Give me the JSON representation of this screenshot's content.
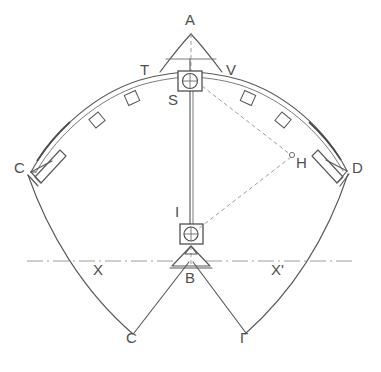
{
  "figure": {
    "type": "technical-line-drawing",
    "background_color": "#ffffff",
    "line_color": "#595959",
    "dashed_line_color": "#8d8d8d"
  },
  "labels": {
    "apex": "A",
    "left_shoulder": "T",
    "right_shoulder": "V",
    "upper_node": "S",
    "left_end": "C",
    "right_end": "D",
    "hinge_point": "H",
    "mast_lower": "I",
    "base_node": "B",
    "axis_left": "X",
    "axis_right": "X'",
    "lower_left_foot": "Ϲ",
    "lower_right_foot": "Γ"
  },
  "points": {
    "A": {
      "x": 191,
      "y": 27,
      "label": "A"
    },
    "T": {
      "x": 147,
      "y": 70,
      "label": "T"
    },
    "V": {
      "x": 231,
      "y": 71,
      "label": "V"
    },
    "S": {
      "x": 173,
      "y": 98,
      "label": "S"
    },
    "C": {
      "x": 21,
      "y": 169,
      "label": "C"
    },
    "D": {
      "x": 356,
      "y": 168,
      "label": "D"
    },
    "H": {
      "x": 296,
      "y": 162,
      "label": "H"
    },
    "I": {
      "x": 179,
      "y": 212,
      "label": "I"
    },
    "B": {
      "x": 190,
      "y": 278,
      "label": "B"
    },
    "X": {
      "x": 100,
      "y": 270,
      "label": "X"
    },
    "Xprime": {
      "x": 276,
      "y": 270,
      "label": "X'"
    },
    "Sigma": {
      "x": 132,
      "y": 340,
      "label": "Ϲ"
    },
    "Gamma": {
      "x": 245,
      "y": 340,
      "label": "Γ"
    }
  },
  "elements": {
    "apex_triangle": "triangle at apex A",
    "center_mast": "vertical mast from S node to B base",
    "upper_pulley": "square box with circle and crosshair at S",
    "lower_pulley": "square box with circle and crosshair at I",
    "base_tripod": "triangular base support at B",
    "main_arch": "double-line arch from C through S apex to D",
    "arch_clamps": "six rectangular clamp fittings along the arch",
    "outer_curves": "two outer curves from C and D sweeping down to the feet",
    "guy_lines": "straight guy lines from B to feet Ϲ and Γ",
    "dashed_stay": "dashed stay lines S to H and H to I",
    "centerline": "dash-dot horizontal centerline X to X'"
  }
}
